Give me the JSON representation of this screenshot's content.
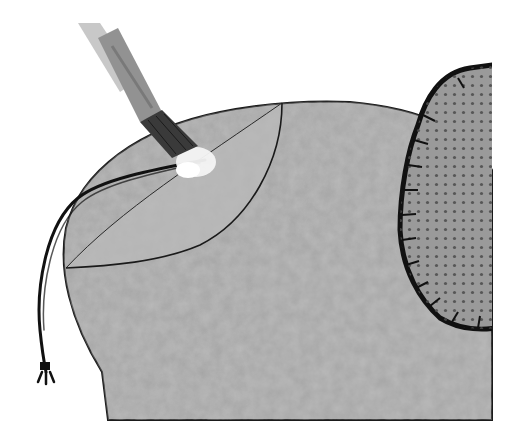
{
  "scene": {
    "description": "Craft illustration: paintbrush dabbing white paint onto grey felt shape with leaf outline, dotted scalloped shape, and knotted black cord",
    "colors": {
      "background": "#ffffff",
      "felt": "#a6a6a6",
      "felt_light": "#b9b9b9",
      "leaf": "#b4b4b4",
      "outline": "#1a1a1a",
      "dotted_shape": "#9a9a9a",
      "dots": "#4a4a4a",
      "brush_handle": "#bdbdbd",
      "brush_ferrule": "#8e8e8e",
      "bristles": "#3a3a3a",
      "paint": "#f4f4f4",
      "cord": "#111111"
    },
    "icons": [
      "paintbrush-icon",
      "felt-shape",
      "leaf-outline",
      "dotted-scalloped-shape",
      "cord"
    ]
  }
}
